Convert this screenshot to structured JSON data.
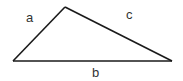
{
  "diagram": {
    "type": "triangle",
    "stroke_color": "#1a1a1a",
    "vertices": {
      "left": [
        13,
        61
      ],
      "apex": [
        65,
        7
      ],
      "right": [
        172,
        61
      ]
    },
    "sides": [
      {
        "name": "a",
        "label": "a",
        "from": "left",
        "to": "apex"
      },
      {
        "name": "c",
        "label": "c",
        "from": "apex",
        "to": "right"
      },
      {
        "name": "b",
        "label": "b",
        "from": "left",
        "to": "right"
      }
    ]
  }
}
